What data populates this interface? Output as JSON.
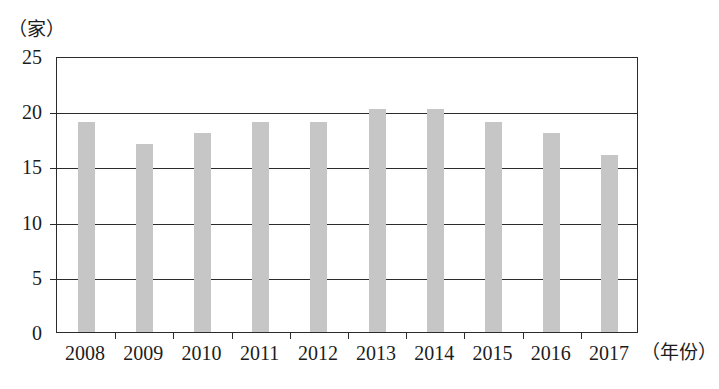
{
  "chart_data": {
    "type": "bar",
    "title": "",
    "subtitle": "",
    "xlabel": "（年份）",
    "ylabel": "（家）",
    "categories": [
      "2008",
      "2009",
      "2010",
      "2011",
      "2012",
      "2013",
      "2014",
      "2015",
      "2016",
      "2017"
    ],
    "values": [
      19,
      17,
      18,
      19,
      19,
      20.2,
      20.2,
      19,
      18,
      16
    ],
    "series": [
      {
        "name": "",
        "values": [
          19,
          17,
          18,
          19,
          19,
          20.2,
          20.2,
          19,
          18,
          16
        ]
      }
    ],
    "ylim": [
      0,
      25
    ],
    "yticks": [
      0,
      5,
      10,
      15,
      20,
      25
    ],
    "ytick_labels": [
      "0",
      "5",
      "10",
      "15",
      "20",
      "25"
    ],
    "grid": true,
    "grid_axis": "y",
    "legend": false,
    "legend_position": "none",
    "bar_color": "#c6c6c6",
    "axis_color": "#2b2b2b",
    "background_color": "#ffffff",
    "annotations": []
  },
  "axes": {
    "y_unit_label": "（家）",
    "x_unit_label": "（年份）"
  }
}
